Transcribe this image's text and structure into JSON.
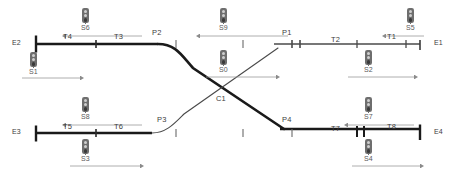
{
  "diagram": {
    "type": "track-schematic",
    "canvas": {
      "width": 456,
      "height": 181
    },
    "colors": {
      "track": "#1a1a1a",
      "link": "#555555",
      "label": "#4a4a4a",
      "signal_body": "#6e6e6e",
      "signal_lamp_off": "#cfcfcf",
      "signal_lamp_on": "#3a3a3a",
      "arrow": "#8a8a8a"
    },
    "tracks_y": {
      "upper": 44,
      "lower": 133
    },
    "endpoints": [
      {
        "id": "E2",
        "label": "E2",
        "x": 14,
        "y": 41,
        "side": "left",
        "track": "upper"
      },
      {
        "id": "E1",
        "label": "E1",
        "x": 437,
        "y": 41,
        "side": "right",
        "track": "upper"
      },
      {
        "id": "E3",
        "label": "E3",
        "x": 14,
        "y": 130,
        "side": "left",
        "track": "lower"
      },
      {
        "id": "E4",
        "label": "E4",
        "x": 437,
        "y": 130,
        "side": "right",
        "track": "lower"
      }
    ],
    "segments": [
      {
        "id": "T4",
        "label": "T4",
        "x": 66,
        "y": 35,
        "track": "upper"
      },
      {
        "id": "T3",
        "label": "T3",
        "x": 117,
        "y": 35,
        "track": "upper"
      },
      {
        "id": "T2",
        "label": "T2",
        "x": 334,
        "y": 38,
        "track": "upper"
      },
      {
        "id": "T1",
        "label": "T1",
        "x": 390,
        "y": 35,
        "track": "upper"
      },
      {
        "id": "T5",
        "label": "T5",
        "x": 66,
        "y": 125,
        "track": "lower"
      },
      {
        "id": "T6",
        "label": "T6",
        "x": 117,
        "y": 125,
        "track": "lower"
      },
      {
        "id": "T7",
        "label": "T7",
        "x": 334,
        "y": 127,
        "track": "lower"
      },
      {
        "id": "T8",
        "label": "T8",
        "x": 390,
        "y": 125,
        "track": "lower"
      }
    ],
    "points": [
      {
        "id": "P2",
        "label": "P2",
        "x": 155,
        "y": 31
      },
      {
        "id": "P1",
        "label": "P1",
        "x": 285,
        "y": 31
      },
      {
        "id": "P3",
        "label": "P3",
        "x": 160,
        "y": 118
      },
      {
        "id": "P4",
        "label": "P4",
        "x": 285,
        "y": 118
      }
    ],
    "crossings": [
      {
        "id": "C1",
        "label": "C1",
        "x": 219,
        "y": 97
      }
    ],
    "signals": [
      {
        "id": "S1",
        "label": "S1",
        "x": 32,
        "y": 54,
        "label_y": 70,
        "direction": "right",
        "arrow_y": 78,
        "arrow_x1": 22,
        "arrow_x2": 80
      },
      {
        "id": "S6",
        "label": "S6",
        "x": 84,
        "y": 10,
        "label_y": 26,
        "direction": "left",
        "arrow_y": 36,
        "arrow_x1": 66,
        "arrow_x2": 142
      },
      {
        "id": "S9",
        "label": "S9",
        "x": 222,
        "y": 10,
        "label_y": 26,
        "direction": "left",
        "arrow_y": 36,
        "arrow_x1": 200,
        "arrow_x2": 288
      },
      {
        "id": "S5",
        "label": "S5",
        "x": 409,
        "y": 10,
        "label_y": 26,
        "direction": "left",
        "arrow_y": 36,
        "arrow_x1": 386,
        "arrow_x2": 424
      },
      {
        "id": "S0",
        "label": "S0",
        "x": 222,
        "y": 52,
        "label_y": 68,
        "direction": "right",
        "arrow_y": 77,
        "arrow_x1": 206,
        "arrow_x2": 276
      },
      {
        "id": "S2",
        "label": "S2",
        "x": 367,
        "y": 52,
        "label_y": 68,
        "direction": "right",
        "arrow_y": 77,
        "arrow_x1": 348,
        "arrow_x2": 414
      },
      {
        "id": "S8",
        "label": "S8",
        "x": 84,
        "y": 99,
        "label_y": 115,
        "direction": "left",
        "arrow_y": 125,
        "arrow_x1": 66,
        "arrow_x2": 142
      },
      {
        "id": "S3",
        "label": "S3",
        "x": 84,
        "y": 141,
        "label_y": 157,
        "direction": "right",
        "arrow_y": 166,
        "arrow_x1": 70,
        "arrow_x2": 140
      },
      {
        "id": "S7",
        "label": "S7",
        "x": 367,
        "y": 99,
        "label_y": 115,
        "direction": "left",
        "arrow_y": 125,
        "arrow_x1": 348,
        "arrow_x2": 414
      },
      {
        "id": "S4",
        "label": "S4",
        "x": 367,
        "y": 141,
        "label_y": 157,
        "direction": "right",
        "arrow_y": 166,
        "arrow_x1": 352,
        "arrow_x2": 420
      }
    ],
    "upper_route": {
      "description": "E2 - T4 - T3 - P2 - diagonal - P4 - T7 - T8 - E4",
      "path": "M 36 44 L 158 44 C 176 44 184 58 196 70 L 284 129 L 420 129"
    },
    "lower_route": {
      "description": "E3 - T5 - T6 - P3 - diagonal - P1 - T2 - T1 - E1",
      "path": "M 36 133 L 152 133 C 168 133 176 122 186 112 L 278 48 L 420 44"
    },
    "tick_marks_upper": [
      96,
      176,
      243,
      291,
      357,
      420
    ],
    "tick_marks_lower": [
      96,
      176,
      243,
      291,
      357,
      420
    ]
  }
}
